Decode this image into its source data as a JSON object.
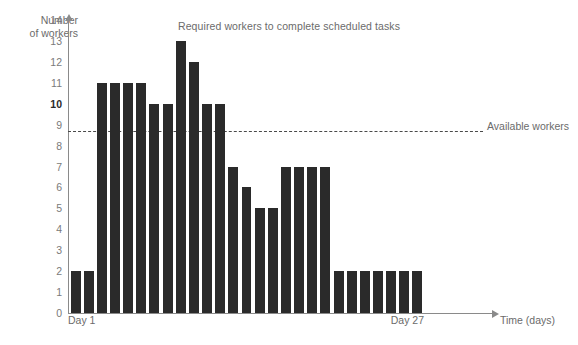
{
  "chart_data": {
    "type": "bar",
    "title": "Required workers to complete scheduled tasks",
    "xlabel": "Time (days)",
    "ylabel": "Number\nof workers",
    "categories": [
      "Day 1",
      "Day 2",
      "Day 3",
      "Day 4",
      "Day 5",
      "Day 6",
      "Day 7",
      "Day 8",
      "Day 9",
      "Day 10",
      "Day 11",
      "Day 12",
      "Day 13",
      "Day 14",
      "Day 15",
      "Day 16",
      "Day 17",
      "Day 18",
      "Day 19",
      "Day 20",
      "Day 21",
      "Day 22",
      "Day 23",
      "Day 24",
      "Day 25",
      "Day 26",
      "Day 27"
    ],
    "values": [
      2,
      2,
      11,
      11,
      11,
      11,
      10,
      10,
      13,
      12,
      10,
      10,
      7,
      6,
      5,
      5,
      7,
      7,
      7,
      7,
      2,
      2,
      2,
      2,
      2,
      2,
      2
    ],
    "ylim": [
      0,
      14
    ],
    "ytick_labels": [
      "0",
      "1",
      "2",
      "3",
      "4",
      "5",
      "6",
      "7",
      "8",
      "9",
      "10",
      "11",
      "12",
      "13",
      "14"
    ],
    "xtick_labels_visible": [
      "Day 1",
      "Day 27"
    ],
    "x_axis_start_label": "Day 1",
    "x_axis_end_label": "Day 27",
    "grid": false,
    "legend": "none",
    "bar_color": "#2a2a2a",
    "axis_color": "#8a8a8a",
    "text_color": "#6b6b6b",
    "annotations": [
      {
        "type": "threshold-line",
        "label": "Available workers",
        "value": 10,
        "style": "dashed",
        "color": "#4a4a4a"
      }
    ]
  }
}
